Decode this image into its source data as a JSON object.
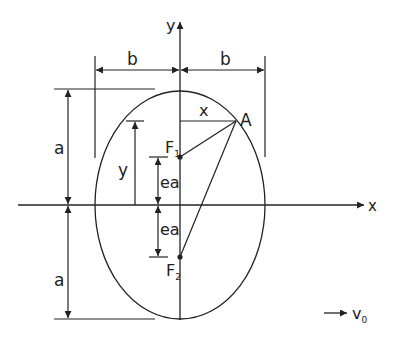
{
  "diagram": {
    "axes": {
      "x_label": "x",
      "y_label": "y"
    },
    "dimensions": {
      "semi_minor_left": "b",
      "semi_minor_right": "b",
      "semi_major_top": "a",
      "semi_major_bottom": "a",
      "focal_upper": "ea",
      "focal_lower": "ea",
      "point_x": "x",
      "point_y": "y"
    },
    "points": {
      "point_a": "A",
      "focus_1": "F",
      "focus_1_sub": "1",
      "focus_2": "F",
      "focus_2_sub": "2"
    },
    "velocity": {
      "label": "v",
      "sub": "0"
    },
    "colors": {
      "stroke": "#222222",
      "background": "#ffffff"
    }
  }
}
